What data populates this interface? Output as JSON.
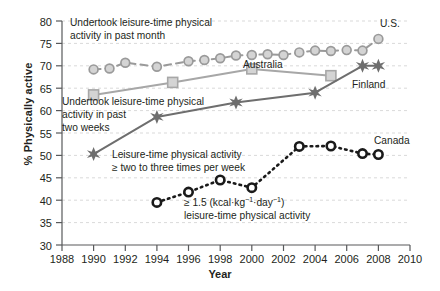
{
  "chart_data": {
    "type": "line",
    "title": "",
    "xlabel": "Year",
    "ylabel": "% Physically active",
    "xlim": [
      1988,
      2010
    ],
    "ylim": [
      30,
      80
    ],
    "xticks": [
      1988,
      1990,
      1992,
      1994,
      1996,
      1998,
      2000,
      2002,
      2004,
      2006,
      2008,
      2010
    ],
    "yticks": [
      30,
      35,
      40,
      45,
      50,
      55,
      60,
      65,
      70,
      75,
      80
    ],
    "grid": "horizontal-dashed",
    "legend_position": "inline-right-of-series",
    "series": [
      {
        "name": "U.S.",
        "marker": "circle",
        "line_style": "dashed",
        "color": "#9a9a9a",
        "points": [
          {
            "x": 1990,
            "y": 69.2
          },
          {
            "x": 1991,
            "y": 69.4
          },
          {
            "x": 1992,
            "y": 70.7
          },
          {
            "x": 1994,
            "y": 69.8
          },
          {
            "x": 1996,
            "y": 71.0
          },
          {
            "x": 1997,
            "y": 71.3
          },
          {
            "x": 1998,
            "y": 71.7
          },
          {
            "x": 1999,
            "y": 72.3
          },
          {
            "x": 2000,
            "y": 72.4
          },
          {
            "x": 2001,
            "y": 72.6
          },
          {
            "x": 2002,
            "y": 72.4
          },
          {
            "x": 2003,
            "y": 73.0
          },
          {
            "x": 2004,
            "y": 73.4
          },
          {
            "x": 2005,
            "y": 73.3
          },
          {
            "x": 2006,
            "y": 73.5
          },
          {
            "x": 2007,
            "y": 73.4
          },
          {
            "x": 2008,
            "y": 76.0
          }
        ]
      },
      {
        "name": "Australia",
        "marker": "square",
        "line_style": "solid",
        "color": "#a7a7a7",
        "points": [
          {
            "x": 1990,
            "y": 63.5
          },
          {
            "x": 1995,
            "y": 66.3
          },
          {
            "x": 2000,
            "y": 69.3
          },
          {
            "x": 2005,
            "y": 67.8
          }
        ]
      },
      {
        "name": "Finland",
        "marker": "star",
        "line_style": "solid",
        "color": "#6e6e6e",
        "points": [
          {
            "x": 1990,
            "y": 50.3
          },
          {
            "x": 1994,
            "y": 58.6
          },
          {
            "x": 1999,
            "y": 61.8
          },
          {
            "x": 2004,
            "y": 64.0
          },
          {
            "x": 2007,
            "y": 70.0
          },
          {
            "x": 2008,
            "y": 70.0
          }
        ]
      },
      {
        "name": "Canada",
        "marker": "open-circle",
        "line_style": "dotted",
        "color": "#1a1a1a",
        "points": [
          {
            "x": 1994,
            "y": 39.5
          },
          {
            "x": 1996,
            "y": 41.8
          },
          {
            "x": 1998,
            "y": 44.5
          },
          {
            "x": 2000,
            "y": 42.8
          },
          {
            "x": 2003,
            "y": 52.0
          },
          {
            "x": 2005,
            "y": 52.1
          },
          {
            "x": 2007,
            "y": 50.4
          },
          {
            "x": 2008,
            "y": 50.2
          }
        ]
      }
    ],
    "annotations": [
      {
        "id": "us-note",
        "lines": [
          "Undertook leisure-time physical",
          "activity in past month"
        ]
      },
      {
        "id": "australia-note",
        "lines": [
          "Undertook leisure-time physical",
          "activity in past",
          "two weeks"
        ]
      },
      {
        "id": "finland-note",
        "lines": [
          "Leisure-time physical activity",
          "≥ two to three times per week"
        ]
      },
      {
        "id": "canada-note",
        "lines": [
          "≥ 1.5 (kcal·kg⁻¹·day⁻¹)",
          "leisure-time physical activity"
        ]
      }
    ]
  },
  "labels": {
    "us": "U.S.",
    "australia": "Australia",
    "finland": "Finland",
    "canada": "Canada",
    "ylabel": "% Physically active",
    "xlabel": "Year",
    "ytick_30": "30",
    "ytick_35": "35",
    "ytick_40": "40",
    "ytick_45": "45",
    "ytick_50": "50",
    "ytick_55": "55",
    "ytick_60": "60",
    "ytick_65": "65",
    "ytick_70": "70",
    "ytick_75": "75",
    "ytick_80": "80",
    "xtick_1988": "1988",
    "xtick_1990": "1990",
    "xtick_1992": "1992",
    "xtick_1994": "1994",
    "xtick_1996": "1996",
    "xtick_1998": "1998",
    "xtick_2000": "2000",
    "xtick_2002": "2002",
    "xtick_2004": "2004",
    "xtick_2006": "2006",
    "xtick_2008": "2008",
    "xtick_2010": "2010",
    "ann_us_1": "Undertook leisure-time physical",
    "ann_us_2": "activity in past month",
    "ann_au_1": "Undertook leisure-time physical",
    "ann_au_2": "activity in past",
    "ann_au_3": "two weeks",
    "ann_fi_1": "Leisure-time physical activity",
    "ann_fi_2": "≥ two to three times per week",
    "ann_ca_1a": "≥ 1.5 (kcal·kg",
    "ann_ca_1b": "−1",
    "ann_ca_1c": "·day",
    "ann_ca_1d": "−1",
    "ann_ca_1e": ")",
    "ann_ca_2": "leisure-time physical activity"
  }
}
